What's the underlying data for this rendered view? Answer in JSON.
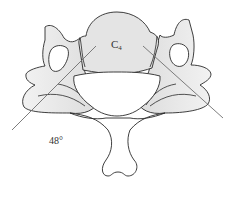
{
  "figure": {
    "vertebra_label": "C",
    "vertebra_subscript": "4",
    "angle_label": "48°",
    "colors": {
      "outline": "#2a2a2a",
      "body_fill": "#e6e6e6",
      "shade_fill": "#e8e8e8",
      "canal_fill": "#ffffff",
      "angle_line": "#6e6e6e",
      "background": "#ffffff"
    }
  }
}
